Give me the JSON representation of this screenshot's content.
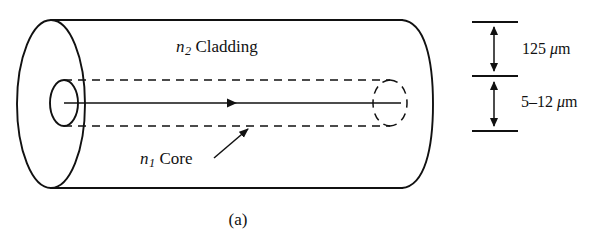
{
  "figure": {
    "caption": "(a)"
  },
  "labels": {
    "cladding": {
      "symbol": "n",
      "subscript": "2",
      "text": "Cladding"
    },
    "core": {
      "symbol": "n",
      "subscript": "1",
      "text": "Core"
    }
  },
  "dimensions": {
    "outer": {
      "value": "125",
      "unit_mu": "μ",
      "unit_m": "m",
      "full": "125 μm"
    },
    "inner": {
      "value": "5–12",
      "unit_mu": "μ",
      "unit_m": "m",
      "full": "5–12 μm"
    }
  },
  "colors": {
    "ink": "#111111",
    "background": "#ffffff"
  }
}
